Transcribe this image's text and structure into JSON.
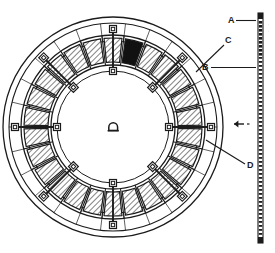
{
  "drawing": {
    "title": "Segmental ring plan – annotated engineering drawing",
    "type": "technical-line-drawing",
    "background_color": "#ffffff",
    "line_color": "#1b1b1b",
    "fill_key_segment_color": "#111111"
  },
  "labels": [
    {
      "id": "A",
      "text": "A",
      "x": 228,
      "y": 17,
      "leader": "horizontal-right"
    },
    {
      "id": "B",
      "text": "B",
      "x": 203,
      "y": 64,
      "leader": "horizontal-right"
    },
    {
      "id": "C",
      "text": "C",
      "x": 226,
      "y": 38,
      "leader": "diagonal-down-left"
    },
    {
      "id": "D",
      "text": "D",
      "x": 248,
      "y": 166,
      "leader": "diagonal-up-left"
    }
  ],
  "ring": {
    "center_x": 113,
    "center_y": 127,
    "outer_radius": 110,
    "ring_radii": [
      110,
      104,
      92,
      86,
      62,
      56
    ],
    "segment_count": 26,
    "hatched_segments": true,
    "key_segment_index": 0,
    "key_segment_fill": "#111111",
    "hatch_angle_deg": 45
  },
  "fasteners": {
    "count": 8,
    "marker_shape": "square-with-inner-square",
    "marker_size": 7,
    "positions_deg": [
      90,
      135,
      180,
      225,
      270,
      315,
      0,
      45
    ],
    "tie_rod": true
  },
  "center_symbol": {
    "name": "arch-symbol",
    "shape": "dome",
    "width": 9,
    "height": 7
  },
  "scale_strip": {
    "name": "vertical-scale-strip",
    "x": 258,
    "y_top": 13,
    "y_bottom": 243,
    "width": 5,
    "pattern": "dashed-ticks",
    "solid_cap_top": true,
    "solid_cap_bottom": true
  },
  "arrow_marker": {
    "name": "direction-arrow",
    "x": 240,
    "y": 124,
    "direction": "right"
  },
  "edge_marks": [
    {
      "text": "·",
      "x": 268,
      "y": 24
    },
    {
      "text": "·",
      "x": 268,
      "y": 31
    }
  ]
}
